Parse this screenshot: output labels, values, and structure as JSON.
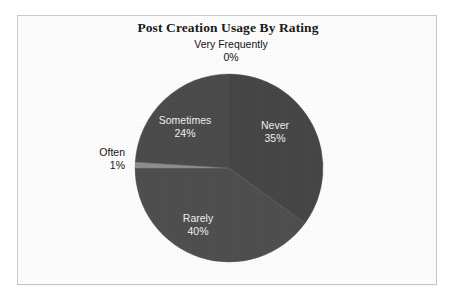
{
  "chart": {
    "title": "Post Creation Usage By Rating",
    "background_color": "#ffffff",
    "border_color": "#c9c9c9"
  },
  "chart_data": {
    "type": "pie",
    "title": "Post Creation Usage By Rating",
    "xlabel": "",
    "ylabel": "",
    "legend": "none",
    "grid": false,
    "data_labels": "category name and percentage",
    "start_angle_deg": 0,
    "direction": "clockwise",
    "categories": [
      "Never",
      "Rarely",
      "Often",
      "Sometimes",
      "Very Frequently"
    ],
    "values": [
      35,
      40,
      1,
      24,
      0
    ],
    "value_unit": "percent",
    "slices": [
      {
        "label": "Never",
        "percent_label": "35%",
        "value": 35,
        "color": "#474747",
        "label_position": "inside"
      },
      {
        "label": "Rarely",
        "percent_label": "40%",
        "value": 40,
        "color": "#505050",
        "label_position": "inside"
      },
      {
        "label": "Often",
        "percent_label": "1%",
        "value": 1,
        "color": "#8f8f8f",
        "label_position": "outside"
      },
      {
        "label": "Sometimes",
        "percent_label": "24%",
        "value": 24,
        "color": "#4c4c4c",
        "label_position": "inside"
      },
      {
        "label": "Very Frequently",
        "percent_label": "0%",
        "value": 0,
        "color": "#666666",
        "label_position": "outside"
      }
    ]
  }
}
